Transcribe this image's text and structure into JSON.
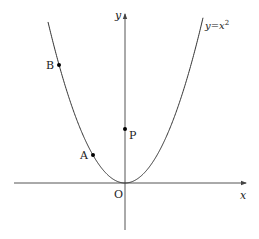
{
  "figure": {
    "type": "coordinate-plane-parabola",
    "curve_label": "y=x²",
    "curve_label_parts": {
      "lhs": "y",
      "eq": "=",
      "base": "x",
      "exp": "2"
    },
    "axes": {
      "x_label": "x",
      "y_label": "y",
      "origin_label": "O"
    },
    "points": [
      {
        "label": "B",
        "description": "point on parabola, upper left"
      },
      {
        "label": "A",
        "description": "point on parabola, near vertex on left"
      },
      {
        "label": "P",
        "description": "point on y-axis"
      }
    ],
    "colors": {
      "stroke": "#333333",
      "axis": "#555555",
      "point": "#000000",
      "background": "#ffffff"
    }
  },
  "geometry": {
    "origin_px": [
      125,
      183
    ],
    "scale_k": 0.02716,
    "x_axis": {
      "x1": 14,
      "x2": 246,
      "y": 183
    },
    "y_axis": {
      "x": 125,
      "y1": 230,
      "y2": 14
    },
    "curve_x_range_px": [
      48,
      203
    ],
    "B_px": [
      59,
      65
    ],
    "A_px": [
      93,
      155
    ],
    "P_px": [
      125,
      129
    ]
  }
}
